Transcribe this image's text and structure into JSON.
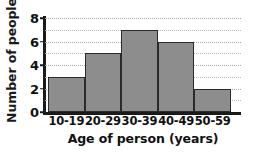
{
  "chart_data": {
    "type": "bar",
    "title": "",
    "subtitle": "",
    "xlabel": "Age of person (years)",
    "ylabel": "Number of people",
    "categories": [
      "10-19",
      "20-29",
      "30-39",
      "40-49",
      "50-59"
    ],
    "values": [
      3,
      5,
      7,
      6,
      2
    ],
    "series": [
      {
        "name": "Number of people",
        "values": [
          3,
          5,
          7,
          6,
          2
        ]
      }
    ],
    "ylim": [
      0,
      8
    ],
    "y_ticks": [
      0,
      2,
      4,
      6,
      8
    ],
    "y_tick_labels": [
      "0",
      "2",
      "4",
      "6",
      "8"
    ],
    "y_minor_gridlines": [
      1,
      3,
      5,
      7
    ],
    "grid": true,
    "grid_axis": "y",
    "grid_style": "dotted",
    "legend": false,
    "legend_position": "none",
    "bar_gap": 0,
    "annotations": []
  },
  "style": {
    "bar_fill": "#8d8d8d",
    "bar_stroke": "#2b2b2b",
    "axis_color": "#1a1a1a",
    "gridline_color": "#b9b9b9",
    "text_color": "#111111",
    "background": "#ffffff"
  }
}
